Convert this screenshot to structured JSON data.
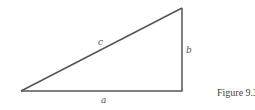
{
  "figure": {
    "caption": "Figure 9.3",
    "shape": "right-triangle",
    "sides": {
      "hypotenuse": "c",
      "vertical_leg": "b",
      "horizontal_leg": "a"
    },
    "line_color": "#555555"
  }
}
